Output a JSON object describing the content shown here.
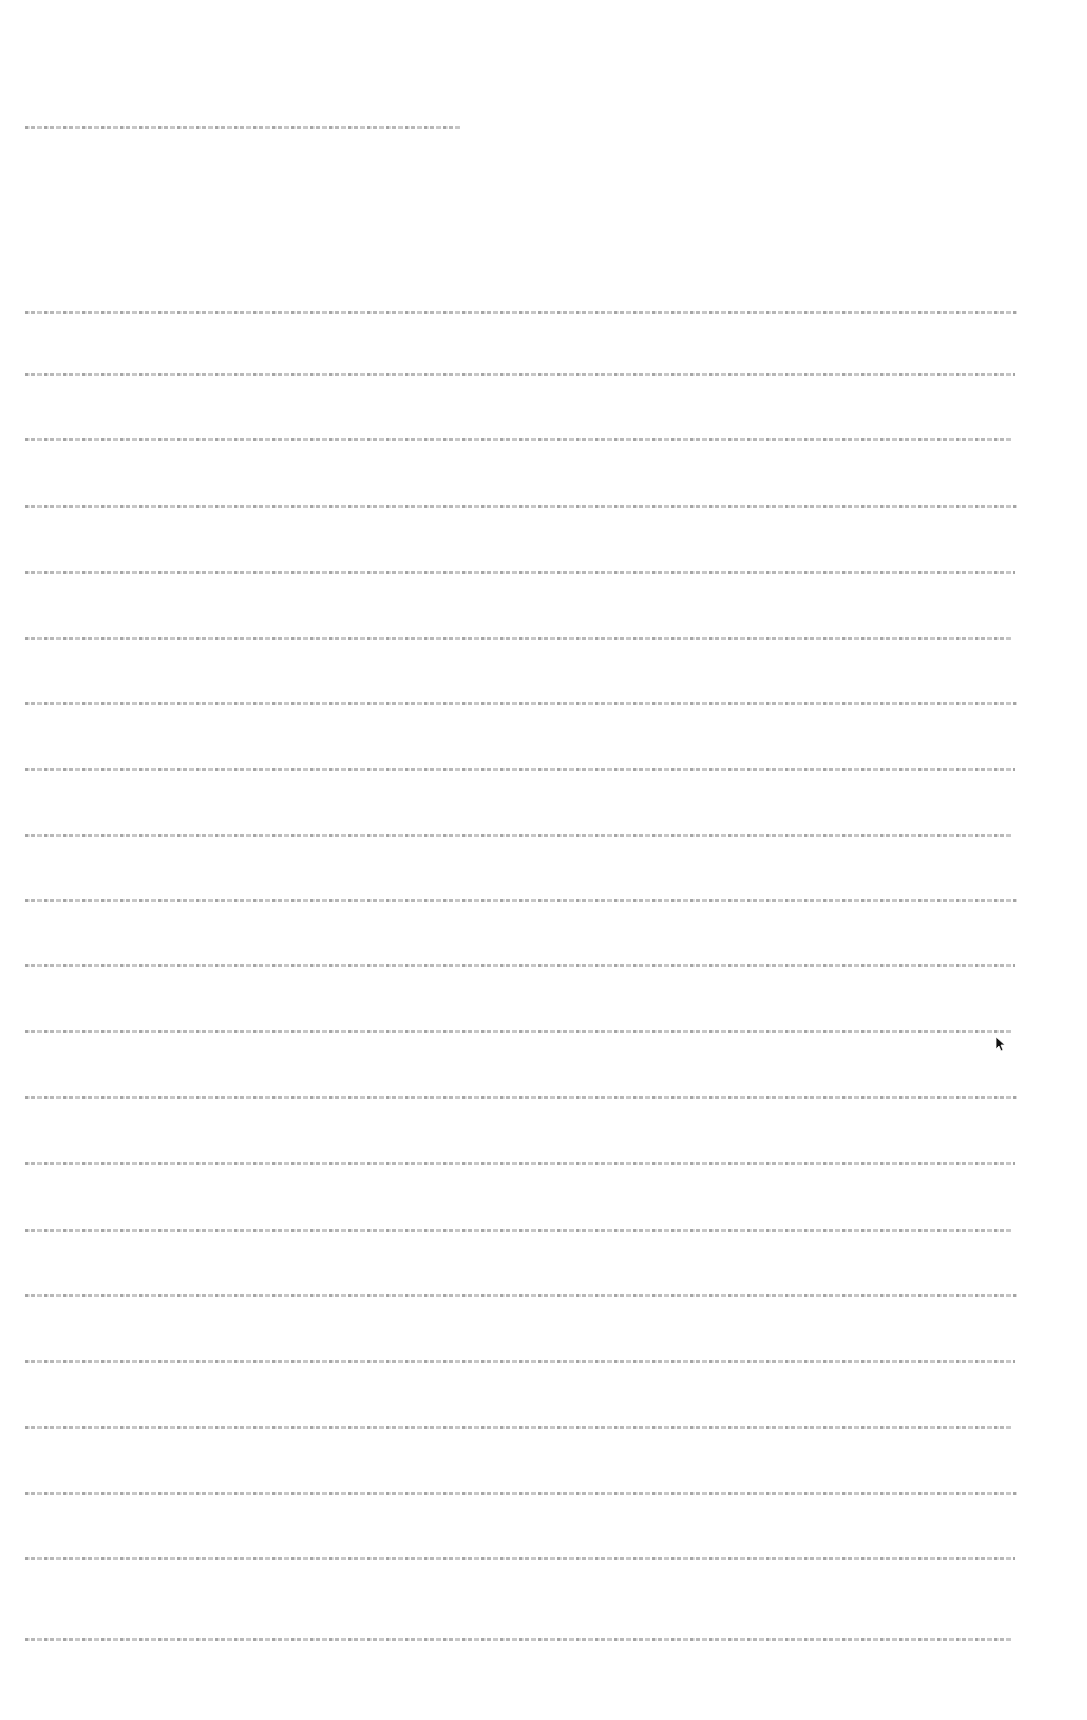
{
  "document": {
    "legibility": "illegible",
    "header_line": {
      "text": "",
      "y": 126,
      "x_start": 25,
      "x_end": 460
    },
    "body_lines": [
      {
        "text": "",
        "y": 311
      },
      {
        "text": "",
        "y": 373
      },
      {
        "text": "",
        "y": 438
      },
      {
        "text": "",
        "y": 505
      },
      {
        "text": "",
        "y": 571
      },
      {
        "text": "",
        "y": 637
      },
      {
        "text": "",
        "y": 702
      },
      {
        "text": "",
        "y": 768
      },
      {
        "text": "",
        "y": 834
      },
      {
        "text": "",
        "y": 899
      },
      {
        "text": "",
        "y": 964
      },
      {
        "text": "",
        "y": 1030
      },
      {
        "text": "",
        "y": 1096
      },
      {
        "text": "",
        "y": 1162
      },
      {
        "text": "",
        "y": 1229
      },
      {
        "text": "",
        "y": 1294
      },
      {
        "text": "",
        "y": 1360
      },
      {
        "text": "",
        "y": 1426
      },
      {
        "text": "",
        "y": 1492
      },
      {
        "text": "",
        "y": 1557
      },
      {
        "text": "",
        "y": 1638
      }
    ],
    "body_x_start": 25,
    "body_x_end": 1017
  },
  "cursor": {
    "x": 995,
    "y": 1036,
    "icon": "arrow-cursor-icon"
  }
}
